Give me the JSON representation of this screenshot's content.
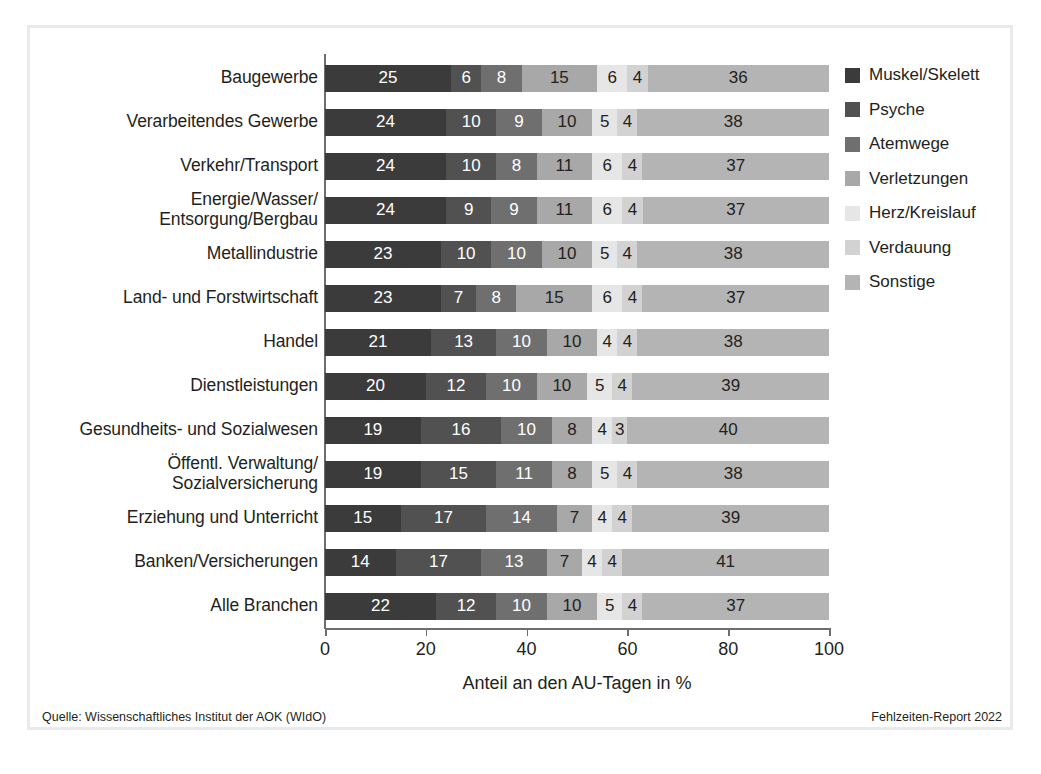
{
  "figure": {
    "source_note": "Quelle: Wissenschaftliches Institut der AOK (WIdO)",
    "report_note": "Fehlzeiten-Report 2022"
  },
  "colors": {
    "muskel_skelett": "#3b3b3b",
    "psyche": "#515151",
    "atemwege": "#6f6f6f",
    "verletzungen": "#a8a8a8",
    "herz_kreislauf": "#e6e6e6",
    "verdauung": "#d2d2d2",
    "sonstige": "#b4b4b4",
    "axis": "#6d6e71",
    "frame": "#e9eaec",
    "text": "#231f20"
  },
  "chart_data": {
    "type": "bar",
    "title": "",
    "subtitle": "",
    "xlabel": "Anteil an den AU-Tagen in %",
    "ylabel": "",
    "xlim": [
      0,
      100
    ],
    "xticks": [
      "0",
      "20",
      "40",
      "60",
      "80",
      "100"
    ],
    "grid": false,
    "orientation": "horizontal",
    "stacked": true,
    "legend_position": "right",
    "legend": [
      "Muskel/Skelett",
      "Psyche",
      "Atemwege",
      "Verletzungen",
      "Herz/Kreislauf",
      "Verdauung",
      "Sonstige"
    ],
    "categories": [
      "Baugewerbe",
      "Verarbeitendes Gewerbe",
      "Verkehr/Transport",
      "Energie/Wasser/\nEntsorgung/Bergbau",
      "Metallindustrie",
      "Land- und Forstwirtschaft",
      "Handel",
      "Dienstleistungen",
      "Gesundheits- und Sozialwesen",
      "Öffentl. Verwaltung/\nSozialversicherung",
      "Erziehung und Unterricht",
      "Banken/Versicherungen",
      "Alle Branchen"
    ],
    "series": [
      {
        "name": "Muskel/Skelett",
        "values": [
          25,
          24,
          24,
          24,
          23,
          23,
          21,
          20,
          19,
          19,
          15,
          14,
          22
        ]
      },
      {
        "name": "Psyche",
        "values": [
          6,
          10,
          10,
          9,
          10,
          7,
          13,
          12,
          16,
          15,
          17,
          17,
          12
        ]
      },
      {
        "name": "Atemwege",
        "values": [
          8,
          9,
          8,
          9,
          10,
          8,
          10,
          10,
          10,
          11,
          14,
          13,
          10
        ]
      },
      {
        "name": "Verletzungen",
        "values": [
          15,
          10,
          11,
          11,
          10,
          15,
          10,
          10,
          8,
          8,
          7,
          7,
          10
        ]
      },
      {
        "name": "Herz/Kreislauf",
        "values": [
          6,
          5,
          6,
          6,
          5,
          6,
          4,
          5,
          4,
          5,
          4,
          4,
          5
        ]
      },
      {
        "name": "Verdauung",
        "values": [
          4,
          4,
          4,
          4,
          4,
          4,
          4,
          4,
          3,
          4,
          4,
          4,
          4
        ]
      },
      {
        "name": "Sonstige",
        "values": [
          36,
          38,
          37,
          37,
          38,
          37,
          38,
          39,
          40,
          38,
          39,
          41,
          37
        ]
      }
    ]
  },
  "rows": [
    {
      "label": "Baugewerbe",
      "label_lines": [
        "Baugewerbe"
      ],
      "values": [
        25,
        6,
        8,
        15,
        6,
        4,
        36
      ]
    },
    {
      "label": "Verarbeitendes Gewerbe",
      "label_lines": [
        "Verarbeitendes Gewerbe"
      ],
      "values": [
        24,
        10,
        9,
        10,
        5,
        4,
        38
      ]
    },
    {
      "label": "Verkehr/Transport",
      "label_lines": [
        "Verkehr/Transport"
      ],
      "values": [
        24,
        10,
        8,
        11,
        6,
        4,
        37
      ]
    },
    {
      "label": "Energie/Wasser/Entsorgung/Bergbau",
      "label_lines": [
        "Energie/Wasser/",
        "Entsorgung/Bergbau"
      ],
      "values": [
        24,
        9,
        9,
        11,
        6,
        4,
        37
      ]
    },
    {
      "label": "Metallindustrie",
      "label_lines": [
        "Metallindustrie"
      ],
      "values": [
        23,
        10,
        10,
        10,
        5,
        4,
        38
      ]
    },
    {
      "label": "Land- und Forstwirtschaft",
      "label_lines": [
        "Land- und Forstwirtschaft"
      ],
      "values": [
        23,
        7,
        8,
        15,
        6,
        4,
        37
      ]
    },
    {
      "label": "Handel",
      "label_lines": [
        "Handel"
      ],
      "values": [
        21,
        13,
        10,
        10,
        4,
        4,
        38
      ]
    },
    {
      "label": "Dienstleistungen",
      "label_lines": [
        "Dienstleistungen"
      ],
      "values": [
        20,
        12,
        10,
        10,
        5,
        4,
        39
      ]
    },
    {
      "label": "Gesundheits- und Sozialwesen",
      "label_lines": [
        "Gesundheits- und Sozialwesen"
      ],
      "values": [
        19,
        16,
        10,
        8,
        4,
        3,
        40
      ]
    },
    {
      "label": "Öffentl. Verwaltung/Sozialversicherung",
      "label_lines": [
        "Öffentl. Verwaltung/",
        "Sozialversicherung"
      ],
      "values": [
        19,
        15,
        11,
        8,
        5,
        4,
        38
      ]
    },
    {
      "label": "Erziehung und Unterricht",
      "label_lines": [
        "Erziehung und Unterricht"
      ],
      "values": [
        15,
        17,
        14,
        7,
        4,
        4,
        39
      ]
    },
    {
      "label": "Banken/Versicherungen",
      "label_lines": [
        "Banken/Versicherungen"
      ],
      "values": [
        14,
        17,
        13,
        7,
        4,
        4,
        41
      ]
    },
    {
      "label": "Alle Branchen",
      "label_lines": [
        "Alle Branchen"
      ],
      "values": [
        22,
        12,
        10,
        10,
        5,
        4,
        37
      ]
    }
  ]
}
